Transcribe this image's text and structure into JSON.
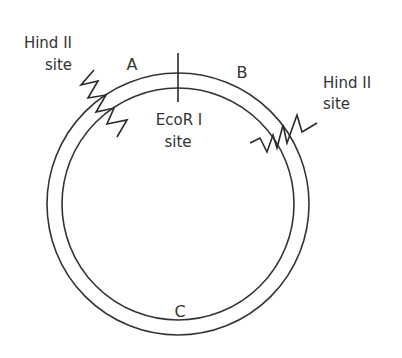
{
  "diagram": {
    "type": "plasmid restriction map",
    "colors": {
      "stroke": "#333333",
      "background": "#ffffff"
    },
    "segments": [
      {
        "id": "A",
        "label": "A"
      },
      {
        "id": "B",
        "label": "B"
      },
      {
        "id": "C",
        "label": "C"
      }
    ],
    "sites": {
      "hind_left": {
        "line1": "Hind II",
        "line2": "site"
      },
      "hind_right": {
        "line1": "Hind II",
        "line2": "site"
      },
      "ecori": {
        "line1": "EcoR I",
        "line2": "site"
      }
    }
  }
}
